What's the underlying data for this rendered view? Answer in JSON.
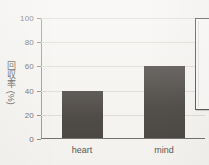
{
  "chart_data": {
    "type": "bar",
    "title": "",
    "subtitle": "",
    "xlabel": "",
    "ylabel": "回収率 (%)",
    "categories": [
      "heart",
      "mind"
    ],
    "values": [
      40,
      60
    ],
    "series": [
      {
        "name": "回収率",
        "values": [
          40,
          60
        ]
      }
    ],
    "ylim": [
      0,
      100
    ],
    "yticks": [
      0,
      20,
      40,
      60,
      80,
      100
    ],
    "ytick_labels": [
      "0",
      "20",
      "40",
      "60",
      "80",
      "100"
    ],
    "grid": "horizontal",
    "legend_position": "right-outside-cropped",
    "annotations": []
  },
  "style": {
    "bar_color": "#403c38",
    "background_color": "#f6f5f2",
    "grid_color": "#dedbd6",
    "axis_color": "#6f6b66",
    "text_color": "#5c5854"
  },
  "legend": {
    "visible": true,
    "cropped": true,
    "entries": []
  }
}
